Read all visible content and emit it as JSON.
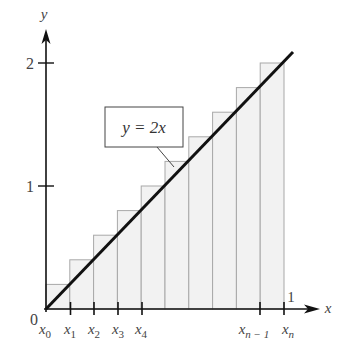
{
  "figure": {
    "type": "riemann-sum-diagram",
    "function_label": "y = 2x",
    "axes": {
      "x_label": "x",
      "y_label": "y",
      "origin_label": "0",
      "y_ticks": [
        {
          "value": 1,
          "label": "1"
        },
        {
          "value": 2,
          "label": "2"
        }
      ],
      "x_end_label": "1"
    },
    "x_tick_labels": [
      {
        "base": "x",
        "sub": "0"
      },
      {
        "base": "x",
        "sub": "1"
      },
      {
        "base": "x",
        "sub": "2"
      },
      {
        "base": "x",
        "sub": "3"
      },
      {
        "base": "x",
        "sub": "4"
      },
      {
        "base": "x",
        "sub": "n − 1"
      },
      {
        "base": "x",
        "sub": "n"
      }
    ],
    "rectangles": {
      "count": 10,
      "heights": [
        0.2,
        0.4,
        0.6,
        0.8,
        1.0,
        1.2,
        1.4,
        1.6,
        1.8,
        2.0
      ],
      "fill": "#f2f2f2",
      "stroke": "#aaaaaa"
    },
    "line": {
      "from": [
        0,
        0
      ],
      "to": [
        1.03,
        2.06
      ],
      "color": "#111111"
    }
  }
}
